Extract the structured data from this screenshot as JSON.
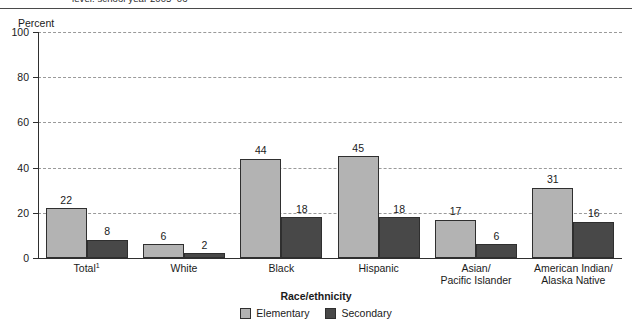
{
  "title": {
    "text": "level: school year 2005–06",
    "clipped": true
  },
  "axis": {
    "y_label": "Percent",
    "x_label": "Race/ethnicity"
  },
  "legend": {
    "items": [
      {
        "label": "Elementary",
        "color": "#b3b3b3"
      },
      {
        "label": "Secondary",
        "color": "#484848"
      }
    ]
  },
  "chart_data": {
    "type": "bar",
    "title": "level: school year 2005–06",
    "xlabel": "Race/ethnicity",
    "ylabel": "Percent",
    "ylim": [
      0,
      100
    ],
    "yticks": [
      0,
      20,
      40,
      60,
      80,
      100
    ],
    "ytick_labels": [
      "0",
      "20",
      "40",
      "60",
      "80",
      "100"
    ],
    "grid": true,
    "legend_position": "bottom",
    "categories": [
      "Total¹",
      "White",
      "Black",
      "Hispanic",
      "Asian/ Pacific Islander",
      "American Indian/ Alaska Native"
    ],
    "category_lines": [
      [
        "Total¹"
      ],
      [
        "White"
      ],
      [
        "Black"
      ],
      [
        "Hispanic"
      ],
      [
        "Asian/",
        "Pacific Islander"
      ],
      [
        "American Indian/",
        "Alaska Native"
      ]
    ],
    "series": [
      {
        "name": "Elementary",
        "color": "#b3b3b3",
        "values": [
          22,
          6,
          44,
          45,
          17,
          31
        ]
      },
      {
        "name": "Secondary",
        "color": "#484848",
        "values": [
          8,
          2,
          18,
          18,
          6,
          16
        ]
      }
    ]
  }
}
